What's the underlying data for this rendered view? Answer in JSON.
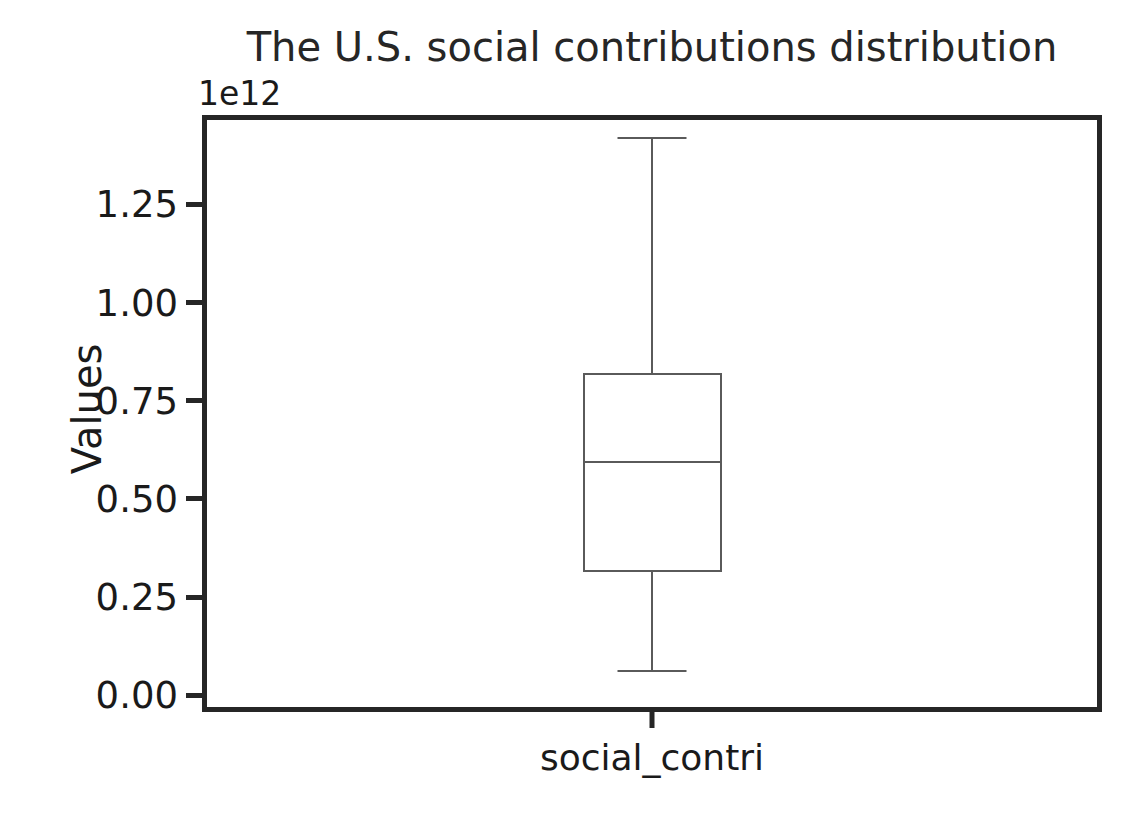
{
  "chart_data": {
    "type": "box",
    "title": "The U.S. social contributions distribution",
    "xlabel": "",
    "ylabel": "Values",
    "offset_text": "1e12",
    "categories": [
      "social_contri"
    ],
    "yticks": [
      "1.25",
      "1.00",
      "0.75",
      "0.50",
      "0.25",
      "0.00"
    ],
    "ytick_values": [
      1.25,
      1.0,
      0.75,
      0.5,
      0.25,
      0.0
    ],
    "ylim": [
      -0.0425,
      1.4775
    ],
    "xlim": [
      0.5,
      1.5
    ],
    "grid": false,
    "legend": null,
    "box_color": "#5a5a5a",
    "axes_color": "#262626",
    "text_color": "#1a1a1a",
    "background": "#ffffff",
    "boxes": [
      {
        "name": "social_contri",
        "position": 1,
        "whisker_low": 0.062,
        "q1": 0.313,
        "median": 0.593,
        "q3": 0.821,
        "whisker_high": 1.419,
        "outliers": []
      }
    ]
  }
}
